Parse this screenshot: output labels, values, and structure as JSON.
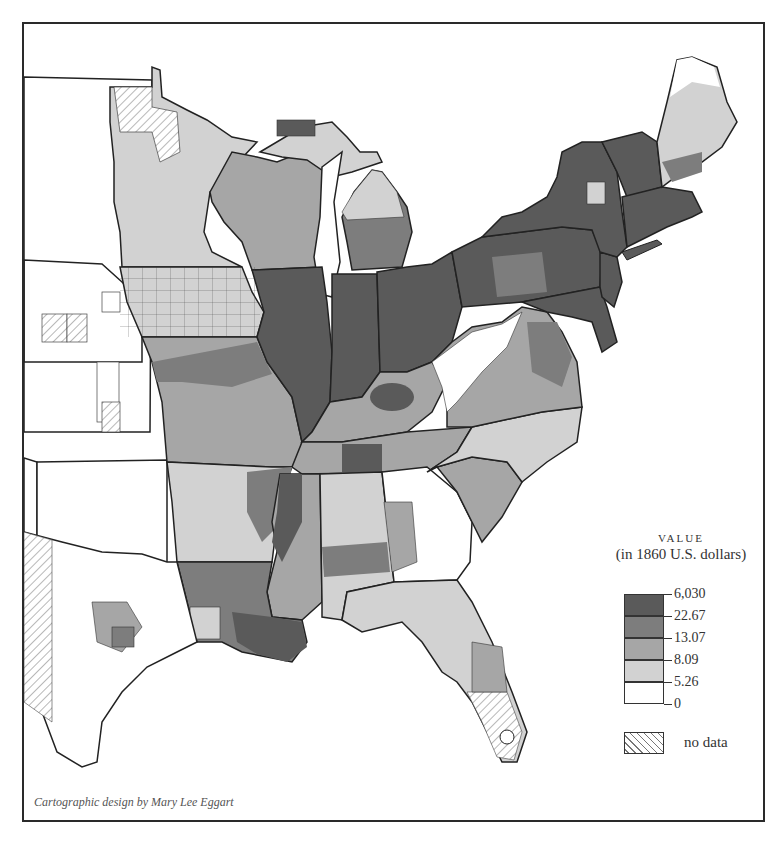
{
  "map": {
    "subject": "Eastern United States counties, 1860",
    "classes_colors": {
      "class5": "#5a5a5a",
      "class4": "#7d7d7d",
      "class3": "#a6a6a6",
      "class2": "#d2d2d2",
      "class1": "#ffffff",
      "nodata": "hatched"
    }
  },
  "legend": {
    "title": "VALUE",
    "subtitle": "(in 1860 U.S. dollars)",
    "breaks": [
      "6,030",
      "22.67",
      "13.07",
      "8.09",
      "5.26",
      "0"
    ],
    "classes": [
      {
        "range": "22.67 – 6,030",
        "color": "#5a5a5a"
      },
      {
        "range": "13.07 – 22.67",
        "color": "#7d7d7d"
      },
      {
        "range": "8.09 – 13.07",
        "color": "#a6a6a6"
      },
      {
        "range": "5.26 – 8.09",
        "color": "#d2d2d2"
      },
      {
        "range": "0 – 5.26",
        "color": "#ffffff"
      }
    ],
    "nodata_label": "no data"
  },
  "credit": "Cartographic design by Mary Lee Eggart"
}
